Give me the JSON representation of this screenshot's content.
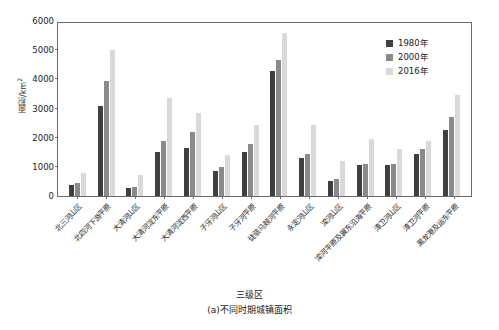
{
  "chart_data": {
    "type": "bar",
    "title": "",
    "caption": "(a)不同时期城镇面积",
    "xlabel": "三级区",
    "ylabel": "面积/km",
    "ylabel_sup": "2",
    "ylim": [
      0,
      6000
    ],
    "yticks": [
      0,
      1000,
      2000,
      3000,
      4000,
      5000,
      6000
    ],
    "grid": false,
    "legend_position": "top-right",
    "categories": [
      "北三河山区",
      "北四河下游平原",
      "大清河山区",
      "大清河淀东平原",
      "大清河淀西平原",
      "子牙河山区",
      "子牙河平原",
      "徒骇马颊河平原",
      "永定河山区",
      "滦河山区",
      "滦河平原及冀东沿海平原",
      "漳卫河山区",
      "漳卫河平原",
      "黑龙港及运东平原"
    ],
    "series": [
      {
        "name": "1980年",
        "color": "#3f3f3f",
        "values": [
          380,
          3080,
          280,
          1500,
          1650,
          850,
          1500,
          4280,
          1300,
          500,
          1080,
          1050,
          1450,
          2250
        ]
      },
      {
        "name": "2000年",
        "color": "#8a8a8a",
        "values": [
          450,
          3950,
          300,
          1900,
          2200,
          980,
          1800,
          4680,
          1450,
          580,
          1100,
          1100,
          1600,
          2700
        ]
      },
      {
        "name": "2016年",
        "color": "#d9d9d9",
        "values": [
          780,
          5000,
          720,
          3350,
          2850,
          1400,
          2450,
          5600,
          2450,
          1200,
          1950,
          1600,
          1900,
          3450
        ]
      }
    ]
  }
}
